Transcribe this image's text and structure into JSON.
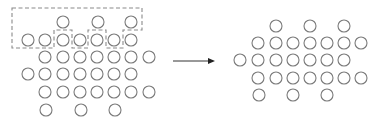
{
  "diagram": {
    "type": "transformation-schematic",
    "circle_radius": 6,
    "colors": {
      "circle_stroke": "#7a7a7a",
      "outline_stroke": "#8a8a8a",
      "arrow": "#222222",
      "background": "#ffffff"
    },
    "left_lattice": {
      "rows": [
        {
          "y": 22,
          "xs": [
            63,
            98,
            131
          ]
        },
        {
          "y": 40,
          "xs": [
            28,
            45,
            63,
            80,
            97,
            114,
            131
          ]
        },
        {
          "y": 57,
          "xs": [
            45,
            63,
            80,
            97,
            114,
            131,
            149
          ]
        },
        {
          "y": 74,
          "xs": [
            28,
            45,
            63,
            80,
            97,
            114,
            131
          ]
        },
        {
          "y": 92,
          "xs": [
            45,
            63,
            80,
            97,
            114,
            131,
            149
          ]
        },
        {
          "y": 110,
          "xs": [
            46,
            81,
            115
          ]
        }
      ],
      "dashed_region": {
        "points": [
          [
            12,
            8
          ],
          [
            142,
            8
          ],
          [
            142,
            30
          ],
          [
            123,
            30
          ],
          [
            123,
            48
          ],
          [
            106,
            48
          ],
          [
            106,
            30
          ],
          [
            88,
            30
          ],
          [
            88,
            48
          ],
          [
            72,
            48
          ],
          [
            72,
            30
          ],
          [
            54,
            30
          ],
          [
            54,
            48
          ],
          [
            12,
            48
          ]
        ]
      }
    },
    "arrow": {
      "x1": 173,
      "y1": 61,
      "x2": 215,
      "y2": 61,
      "direction": "right"
    },
    "right_lattice": {
      "rows": [
        {
          "y": 26,
          "xs": [
            276,
            310,
            344
          ]
        },
        {
          "y": 43,
          "xs": [
            258,
            276,
            293,
            310,
            327,
            344,
            361
          ]
        },
        {
          "y": 60,
          "xs": [
            240,
            258,
            276,
            293,
            310,
            327,
            344
          ]
        },
        {
          "y": 78,
          "xs": [
            258,
            276,
            293,
            310,
            327,
            344,
            361
          ]
        },
        {
          "y": 95,
          "xs": [
            259,
            293,
            327
          ]
        }
      ]
    }
  }
}
